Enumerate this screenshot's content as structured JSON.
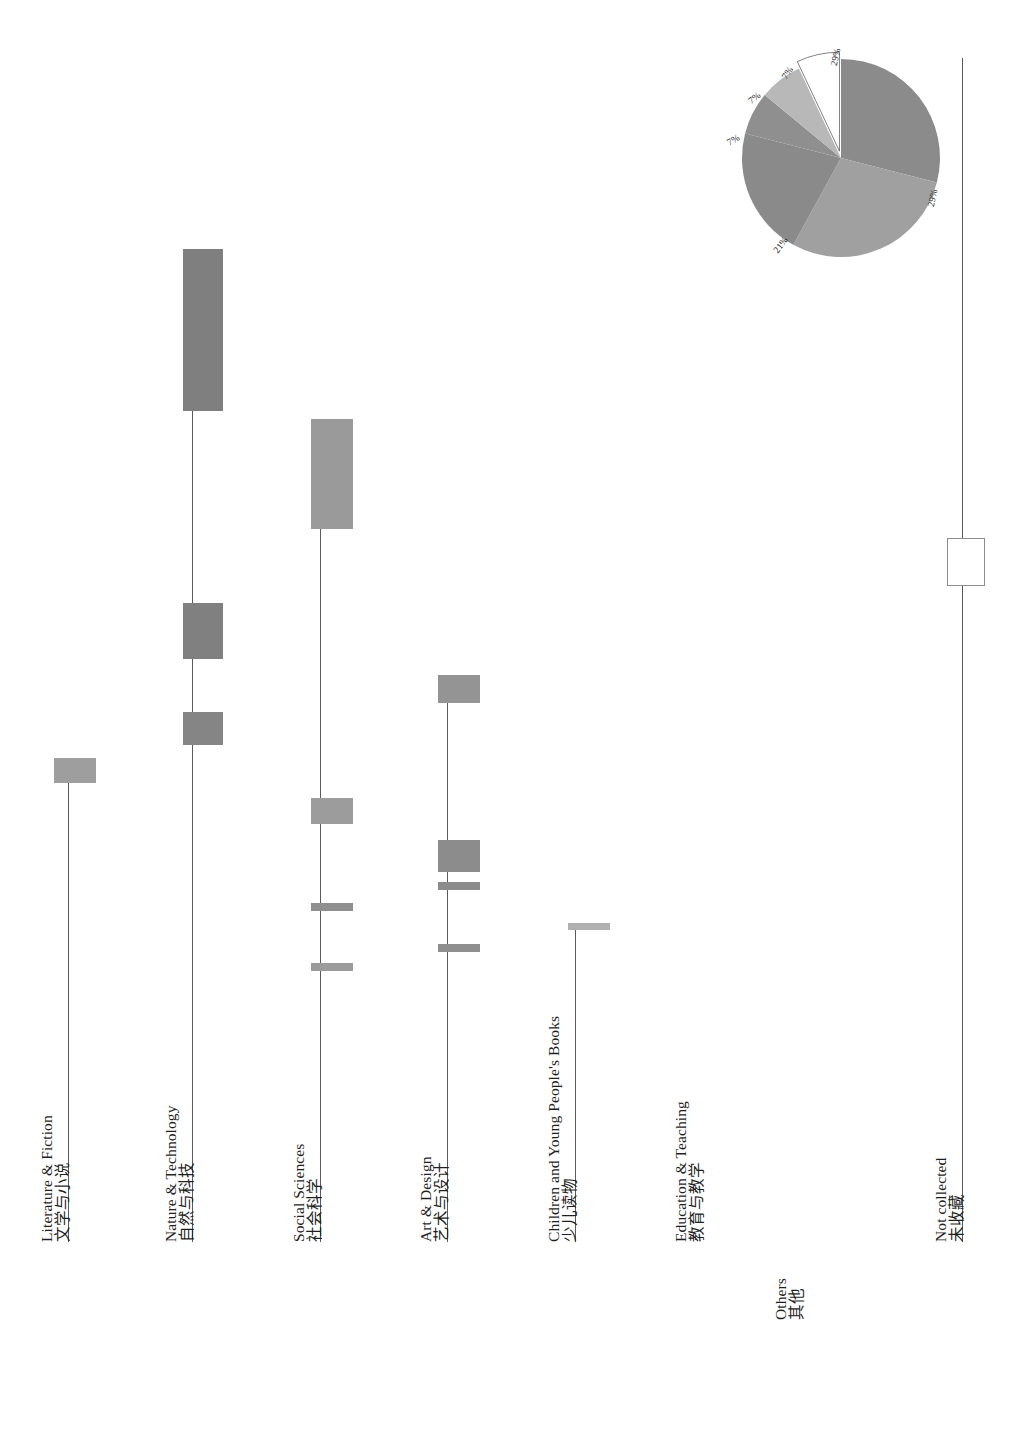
{
  "figure": {
    "orientation": "rotated-90-ccw",
    "background": "#ffffff"
  },
  "chart_data": [
    {
      "type": "bar",
      "title": "",
      "xlabel": "",
      "ylabel": "",
      "orientation": "vertical-rotated",
      "categories": [
        {
          "en": "Literature & Fiction",
          "zh": "文学与小说"
        },
        {
          "en": "Nature & Technology",
          "zh": "自然与科技"
        },
        {
          "en": "Social Sciences",
          "zh": "社会科学"
        },
        {
          "en": "Art & Design",
          "zh": "艺术与设计"
        },
        {
          "en": "Children and Young People's Books",
          "zh": "少儿读物"
        },
        {
          "en": "Education & Teaching",
          "zh": "教育与教学"
        },
        {
          "en": "Others",
          "zh": "其他"
        },
        {
          "en": "Not collected",
          "zh": "未收藏"
        }
      ],
      "series": [
        {
          "name": "series-1",
          "values": [
            8,
            62,
            33,
            16,
            0,
            0,
            1,
            0
          ]
        },
        {
          "name": "series-2",
          "values": [
            0,
            22,
            0,
            0,
            0,
            0,
            0,
            0
          ]
        },
        {
          "name": "series-3",
          "values": [
            0,
            12,
            0,
            12,
            0,
            0,
            0,
            0
          ]
        },
        {
          "name": "series-4",
          "values": [
            0,
            0,
            9,
            3,
            0,
            0,
            0,
            0
          ]
        },
        {
          "name": "series-5",
          "values": [
            0,
            0,
            2,
            2,
            0,
            0,
            0,
            0
          ]
        }
      ],
      "grid": false,
      "legend": "none"
    },
    {
      "type": "pie",
      "title": "",
      "labels": [
        "29%",
        "29%",
        "21%",
        "7%",
        "7%",
        "7%"
      ],
      "values": [
        29,
        29,
        21,
        7,
        7,
        7
      ],
      "exploded_slice": "7%",
      "ring_separators": 4,
      "legend": "none"
    }
  ],
  "bar_chart": {
    "groups": [
      {
        "id": "literature-fiction",
        "label_en": "Literature & Fiction",
        "label_zh": "文学与小说",
        "axis_x": 68,
        "axis_top": 760,
        "axis_bottom": 1242,
        "label_x": 38,
        "label_y": 1242,
        "bars": [
          {
            "id": "bar-lit-1",
            "x": 54,
            "y": 758,
            "w": 42,
            "h": 25,
            "color": "#9e9e9e"
          }
        ]
      },
      {
        "id": "nature-technology",
        "label_en": "Nature & Technology",
        "label_zh": "自然与科技",
        "axis_x": 192,
        "axis_top": 250,
        "axis_bottom": 1242,
        "label_x": 162,
        "label_y": 1242,
        "bars": [
          {
            "id": "bar-nat-1",
            "x": 183,
            "y": 249,
            "w": 40,
            "h": 162,
            "color": "#7f7f7f"
          },
          {
            "id": "bar-nat-2",
            "x": 183,
            "y": 603,
            "w": 40,
            "h": 56,
            "color": "#808080"
          },
          {
            "id": "bar-nat-3",
            "x": 183,
            "y": 712,
            "w": 40,
            "h": 33,
            "color": "#858585"
          }
        ]
      },
      {
        "id": "social-sciences",
        "label_en": "Social Sciences",
        "label_zh": "社会科学",
        "axis_x": 320,
        "axis_top": 420,
        "axis_bottom": 1242,
        "label_x": 290,
        "label_y": 1242,
        "bars": [
          {
            "id": "bar-soc-1",
            "x": 311,
            "y": 419,
            "w": 42,
            "h": 110,
            "color": "#9a9a9a"
          },
          {
            "id": "bar-soc-2",
            "x": 311,
            "y": 798,
            "w": 42,
            "h": 26,
            "color": "#9c9c9c"
          },
          {
            "id": "bar-soc-3",
            "x": 311,
            "y": 903,
            "w": 42,
            "h": 8,
            "color": "#8f8f8f"
          },
          {
            "id": "bar-soc-4",
            "x": 311,
            "y": 963,
            "w": 42,
            "h": 8,
            "color": "#9b9b9b"
          }
        ]
      },
      {
        "id": "art-design",
        "label_en": "Art & Design",
        "label_zh": "艺术与设计",
        "axis_x": 447,
        "axis_top": 676,
        "axis_bottom": 1242,
        "label_x": 417,
        "label_y": 1242,
        "bars": [
          {
            "id": "bar-art-1",
            "x": 438,
            "y": 675,
            "w": 42,
            "h": 28,
            "color": "#949494"
          },
          {
            "id": "bar-art-2",
            "x": 438,
            "y": 840,
            "w": 42,
            "h": 32,
            "color": "#8c8c8c"
          },
          {
            "id": "bar-art-3",
            "x": 438,
            "y": 882,
            "w": 42,
            "h": 8,
            "color": "#8c8c8c"
          },
          {
            "id": "bar-art-4",
            "x": 438,
            "y": 944,
            "w": 42,
            "h": 8,
            "color": "#8f8f8f"
          }
        ]
      },
      {
        "id": "children-young-people",
        "label_en": "Children and Young People's Books",
        "label_zh": "少儿读物",
        "axis_x": 575,
        "axis_top": 925,
        "axis_bottom": 1242,
        "label_x": 545,
        "label_y": 1242,
        "bars": [
          {
            "id": "bar-child-1",
            "x": 568,
            "y": 923,
            "w": 42,
            "h": 7,
            "color": "#b0b0b0"
          }
        ]
      },
      {
        "id": "education-teaching",
        "label_en": "Education & Teaching",
        "label_zh": "教育与教学",
        "axis_x": 700,
        "axis_top": 1242,
        "axis_bottom": 1242,
        "label_x": 672,
        "label_y": 1242,
        "bars": []
      },
      {
        "id": "others",
        "label_en": "Others",
        "label_zh": "其他",
        "axis_x": 800,
        "axis_top": 1295,
        "axis_bottom": 1295,
        "label_x": 772,
        "label_y": 1320,
        "bars": []
      },
      {
        "id": "not-collected",
        "label_en": "Not collected",
        "label_zh": "未收藏",
        "axis_x": 962,
        "axis_top": 58,
        "axis_bottom": 1242,
        "label_x": 932,
        "label_y": 1242,
        "bars": [
          {
            "id": "bar-notcollected-1",
            "x": 947,
            "y": 538,
            "w": 36,
            "h": 46,
            "color": "#ffffff",
            "border": "#8d8d8d"
          }
        ]
      }
    ]
  },
  "pie_chart": {
    "center_x": 841,
    "center_y": 158,
    "radius": 99,
    "slices": [
      {
        "id": "slice-29a",
        "label": "29%",
        "value": 29,
        "color": "#8b8b8b",
        "exploded": false
      },
      {
        "id": "slice-29b",
        "label": "29%",
        "value": 29,
        "color": "#a0a0a0",
        "exploded": false
      },
      {
        "id": "slice-21",
        "label": "21%",
        "value": 21,
        "color": "#8a8a8a",
        "exploded": false
      },
      {
        "id": "slice-7a",
        "label": "7%",
        "value": 7,
        "color": "#8f8f8f",
        "exploded": false
      },
      {
        "id": "slice-7b",
        "label": "7%",
        "value": 7,
        "color": "#b8b8b8",
        "exploded": false
      },
      {
        "id": "slice-7c",
        "label": "7%",
        "value": 7,
        "color": "#ffffff",
        "exploded": true
      }
    ],
    "labels": [
      {
        "id": "pie-label-29a",
        "text": "29%",
        "x": 827,
        "y": 52,
        "rot": -78
      },
      {
        "id": "pie-label-29b",
        "text": "29%",
        "x": 924,
        "y": 193,
        "rot": -78
      },
      {
        "id": "pie-label-21",
        "text": "21%",
        "x": 772,
        "y": 240,
        "rot": -52
      },
      {
        "id": "pie-label-7a",
        "text": "7%",
        "x": 727,
        "y": 135,
        "rot": -30
      },
      {
        "id": "pie-label-7b",
        "text": "7%",
        "x": 748,
        "y": 93,
        "rot": -38
      },
      {
        "id": "pie-label-7c",
        "text": "7%",
        "x": 781,
        "y": 68,
        "rot": -55
      }
    ]
  }
}
